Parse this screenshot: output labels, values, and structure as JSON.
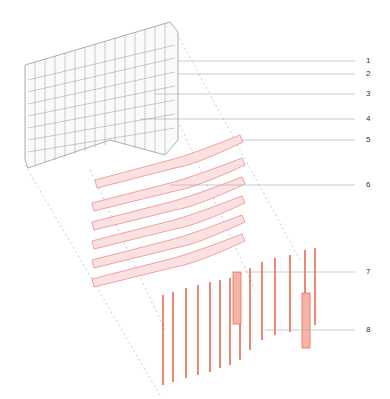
{
  "diagram": {
    "type": "exploded-axonometric",
    "layers": [
      {
        "name": "facade-grid",
        "color": "#888888"
      },
      {
        "name": "floor-slabs",
        "color": "#f2a0a0",
        "fill": "#fbe3e3"
      },
      {
        "name": "vertical-fins",
        "color": "#ee6a50"
      }
    ],
    "callouts": [
      {
        "label": "1",
        "y": 61
      },
      {
        "label": "2",
        "y": 74
      },
      {
        "label": "3",
        "y": 94
      },
      {
        "label": "4",
        "y": 119
      },
      {
        "label": "5",
        "y": 140
      },
      {
        "label": "6",
        "y": 185
      },
      {
        "label": "7",
        "y": 272
      },
      {
        "label": "8",
        "y": 330
      }
    ]
  }
}
